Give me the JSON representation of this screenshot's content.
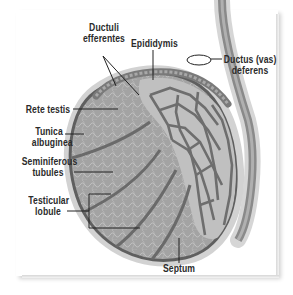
{
  "diagram": {
    "colors": {
      "tissue_fill": "#9a9a9a",
      "tissue_light": "#b8b8b8",
      "duct_stroke": "#6e6e6e",
      "capsule": "#5f5f5f",
      "outer_halo": "#cfcfcf",
      "label_text": "#2b2b2b",
      "leader_line": "#222222"
    },
    "labels": {
      "ductuli_efferentes_line1": "Ductuli",
      "ductuli_efferentes_line2": "efferentes",
      "epididymis": "Epididymis",
      "ductus_deferens_line1": "Ductus (vas)",
      "ductus_deferens_line2": "deferens",
      "rete_testis": "Rete testis",
      "tunica_albuginea_line1": "Tunica",
      "tunica_albuginea_line2": "albuginea",
      "seminiferous_tubules_line1": "Seminiferous",
      "seminiferous_tubules_line2": "tubules",
      "testicular_lobule_line1": "Testicular",
      "testicular_lobule_line2": "lobule",
      "septum": "Septum"
    }
  }
}
